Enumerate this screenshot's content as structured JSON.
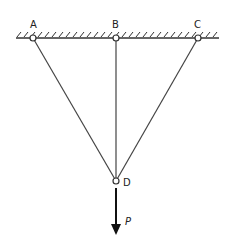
{
  "diagram": {
    "labels": {
      "A": "A",
      "B": "B",
      "C": "C",
      "D": "D",
      "P": "P"
    },
    "nodes": [
      {
        "id": "A",
        "x": 33,
        "y": 38,
        "type": "pin-support"
      },
      {
        "id": "B",
        "x": 116,
        "y": 38,
        "type": "pin-support"
      },
      {
        "id": "C",
        "x": 198,
        "y": 38,
        "type": "pin-support"
      },
      {
        "id": "D",
        "x": 116,
        "y": 181,
        "type": "joint"
      }
    ],
    "members": [
      {
        "from": "A",
        "to": "D"
      },
      {
        "from": "B",
        "to": "D"
      },
      {
        "from": "C",
        "to": "D"
      }
    ],
    "load": {
      "at": "D",
      "direction": "down",
      "label": "P"
    },
    "ceiling": {
      "x1": 16,
      "x2": 219,
      "y": 38,
      "hatched": true
    }
  }
}
